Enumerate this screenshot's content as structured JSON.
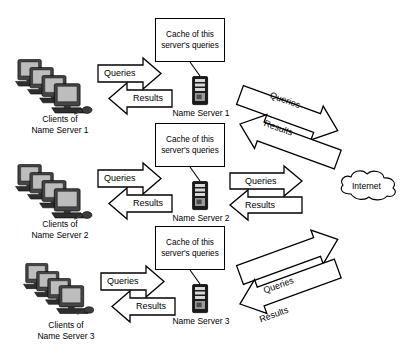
{
  "diagram": {
    "colors": {
      "stroke": "#000000",
      "fill": "#ffffff",
      "monitor_dark": "#3a3a3a",
      "monitor_screen": "#bfbfbf",
      "server_dark": "#1a1a1a",
      "server_bay": "#d9d9d9"
    },
    "cache_boxes": [
      {
        "id": "cache-1",
        "text": "Cache of this\nserver's\nqueries"
      },
      {
        "id": "cache-2",
        "text": "Cache of this\nserver's\nqueries"
      },
      {
        "id": "cache-3",
        "text": "Cache of this\nserver's\nqueries"
      }
    ],
    "client_groups": [
      {
        "id": "clients-1",
        "label": "Clients of\nName Server 1",
        "monitor_count": 4
      },
      {
        "id": "clients-2",
        "label": "Clients of\nName Server 2",
        "monitor_count": 4
      },
      {
        "id": "clients-3",
        "label": "Clients of\nName Server 3",
        "monitor_count": 4
      }
    ],
    "servers": [
      {
        "id": "server-1",
        "label": "Name Server 1"
      },
      {
        "id": "server-2",
        "label": "Name Server 2"
      },
      {
        "id": "server-3",
        "label": "Name Server 3"
      }
    ],
    "cloud": {
      "id": "internet-cloud",
      "label": "Internet"
    },
    "client_arrows": [
      {
        "id": "client-queries-1",
        "label": "Queries",
        "direction": "right"
      },
      {
        "id": "client-results-1",
        "label": "Results",
        "direction": "left"
      },
      {
        "id": "client-queries-2",
        "label": "Queries",
        "direction": "right"
      },
      {
        "id": "client-results-2",
        "label": "Results",
        "direction": "left"
      },
      {
        "id": "client-queries-3",
        "label": "Queries",
        "direction": "right"
      },
      {
        "id": "client-results-3",
        "label": "Results",
        "direction": "left"
      }
    ],
    "internet_arrows": [
      {
        "id": "net-queries-1",
        "label": "Queries",
        "direction": "down-right"
      },
      {
        "id": "net-results-1",
        "label": "Results",
        "direction": "up-left"
      },
      {
        "id": "net-queries-2",
        "label": "Queries",
        "direction": "right"
      },
      {
        "id": "net-results-2",
        "label": "Results",
        "direction": "left"
      },
      {
        "id": "net-queries-3",
        "label": "Queries",
        "direction": "up-right"
      },
      {
        "id": "net-results-3",
        "label": "Results",
        "direction": "down-left"
      }
    ]
  }
}
